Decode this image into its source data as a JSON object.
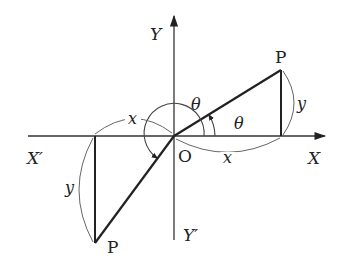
{
  "diagram": {
    "title": "",
    "axes": {
      "x_positive_label": "X",
      "x_negative_label": "X′",
      "y_positive_label": "Y",
      "y_negative_label": "Y′",
      "origin_label": "O"
    },
    "points": {
      "p_upper_label": "P",
      "p_lower_label": "P"
    },
    "angles": {
      "theta_small_label": "θ",
      "theta_large_label": "θ"
    },
    "lengths": {
      "x_right_label": "x",
      "y_right_label": "y",
      "x_left_label": "x",
      "y_left_label": "y"
    },
    "colors": {
      "line": "#222222",
      "arc": "#555555",
      "background": "#ffffff"
    }
  }
}
